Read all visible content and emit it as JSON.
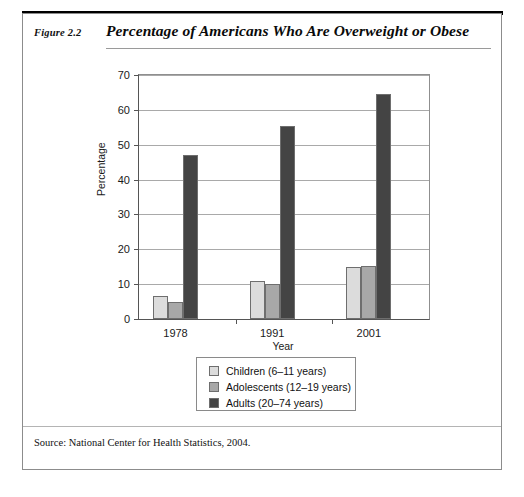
{
  "figure": {
    "label": "Figure 2.2",
    "title": "Percentage of Americans Who Are Overweight or Obese",
    "source": "Source: National Center for Health Statistics, 2004."
  },
  "chart_data": {
    "type": "bar",
    "title": "Percentage of Americans Who Are Overweight or Obese",
    "xlabel": "Year",
    "ylabel": "Percentage",
    "categories": [
      "1978",
      "1991",
      "2001"
    ],
    "series": [
      {
        "name": "Children (6–11 years)",
        "values": [
          6.5,
          11,
          15
        ],
        "color": "#dcdcdc"
      },
      {
        "name": "Adolescents (12–19 years)",
        "values": [
          5,
          10,
          15.3
        ],
        "color": "#a8a8a8"
      },
      {
        "name": "Adults (20–74 years)",
        "values": [
          47,
          55.5,
          64.5
        ],
        "color": "#444444"
      }
    ],
    "ylim": [
      0,
      70
    ],
    "yticks": [
      0,
      10,
      20,
      30,
      40,
      50,
      60,
      70
    ],
    "ytick_labels": [
      "0",
      "10",
      "20",
      "30",
      "40",
      "50",
      "60",
      "70"
    ],
    "grid": true,
    "legend_position": "below-plot"
  },
  "colors": {
    "children": "#dcdcdc",
    "adolescents": "#a8a8a8",
    "adults": "#444444",
    "gridline": "#a9a9a9",
    "axis": "#555555"
  }
}
